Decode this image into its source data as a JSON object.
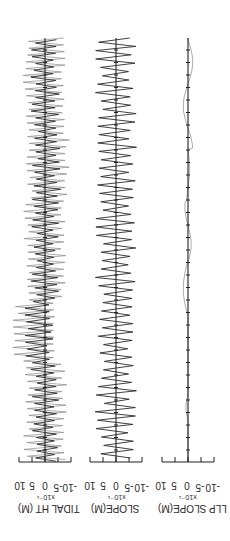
{
  "figure": {
    "orientation": "rotated-90",
    "panels": [
      {
        "id": "tidal",
        "label": "TIDAL HT (M)",
        "scale": "x10⁻¹",
        "ticks": [
          "10",
          "5",
          "0",
          "-5",
          "-10"
        ]
      },
      {
        "id": "slope",
        "label": "SLOPE(M)",
        "scale": "x10⁻¹",
        "ticks": [
          "10",
          "5",
          "0",
          "-5",
          "-10"
        ]
      },
      {
        "id": "llp",
        "label": "LLP SLOPE(M)",
        "scale": "x10⁻¹",
        "ticks": [
          "10",
          "5",
          "0",
          "-5",
          "-10"
        ]
      }
    ]
  },
  "colors": {
    "trace": "#2b2b2b",
    "trace_light": "#8a8a8a",
    "axis": "#222222",
    "background": "#ffffff"
  },
  "chart_data": [
    {
      "type": "line",
      "title": "",
      "ylabel": "TIDAL HT (M) x10^-1",
      "xlabel": "time",
      "ylim": [
        -10,
        10
      ],
      "yticks": [
        10,
        5,
        0,
        -5,
        -10
      ],
      "series": [
        {
          "name": "tidal height (dark)",
          "description": "high-frequency oscillation, amplitude ~3-6 (x10^-1 m)"
        },
        {
          "name": "tidal height (light)",
          "description": "overlaid oscillation, amplitude ~6-8, envelope shifts toward positive near mid-record"
        }
      ],
      "grid": false
    },
    {
      "type": "line",
      "title": "",
      "ylabel": "SLOPE(M) x10^-1",
      "xlabel": "time",
      "ylim": [
        -10,
        10
      ],
      "yticks": [
        10,
        5,
        0,
        -5,
        -10
      ],
      "series": [
        {
          "name": "slope",
          "description": "regular oscillation, amplitude ~5-8 (x10^-1 m)"
        }
      ],
      "grid": false
    },
    {
      "type": "line",
      "title": "",
      "ylabel": "LLP SLOPE(M) x10^-1",
      "xlabel": "time",
      "ylim": [
        -10,
        10
      ],
      "yticks": [
        10,
        5,
        0,
        -5,
        -10
      ],
      "series": [
        {
          "name": "low-pass slope",
          "description": "near-zero residual, small excursions up to ~2 (x10^-1 m)"
        }
      ],
      "grid": false
    }
  ]
}
